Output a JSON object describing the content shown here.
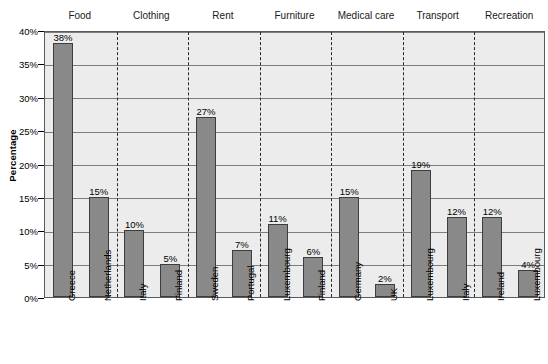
{
  "chart_data": {
    "type": "bar",
    "title": "",
    "xlabel": "",
    "ylabel": "Percentage",
    "ylim": [
      0,
      40
    ],
    "ytick_labels": [
      "0%",
      "5%",
      "10%",
      "15%",
      "20%",
      "25%",
      "30%",
      "35%",
      "40%"
    ],
    "ytick_values": [
      0,
      5,
      10,
      15,
      20,
      25,
      30,
      35,
      40
    ],
    "grid": "horizontal",
    "legend": "none",
    "group_separators": "dashed vertical lines",
    "categories": [
      "Greece",
      "Netherlands",
      "Italy",
      "Finland",
      "Sweden",
      "Portugal",
      "Luxembourg",
      "Finland",
      "Germany",
      "UK",
      "Luxembourg",
      "Italy",
      "Ireland",
      "Luxembourg"
    ],
    "values": [
      38,
      15,
      10,
      5,
      27,
      7,
      11,
      6,
      15,
      2,
      19,
      12,
      12,
      4
    ],
    "data_labels": [
      "38%",
      "15%",
      "10%",
      "5%",
      "27%",
      "7%",
      "11%",
      "6%",
      "15%",
      "2%",
      "19%",
      "12%",
      "12%",
      "4%"
    ],
    "groups": [
      {
        "label": "Food",
        "members": [
          "Greece",
          "Netherlands"
        ]
      },
      {
        "label": "Clothing",
        "members": [
          "Italy",
          "Finland"
        ]
      },
      {
        "label": "Rent",
        "members": [
          "Sweden",
          "Portugal"
        ]
      },
      {
        "label": "Furniture",
        "members": [
          "Luxembourg",
          "Finland"
        ]
      },
      {
        "label": "Medical care",
        "members": [
          "Germany",
          "UK"
        ]
      },
      {
        "label": "Transport",
        "members": [
          "Luxembourg",
          "Italy"
        ]
      },
      {
        "label": "Recreation",
        "members": [
          "Ireland",
          "Luxembourg"
        ]
      }
    ],
    "colors": {
      "bar_fill": "#898989",
      "bar_border": "#3d3d3d",
      "plot_background": "#ececec",
      "gridline": "#7d7d7d",
      "axis": "#5a5a5a",
      "divider": "#2b2b2b",
      "text": "#000000"
    }
  }
}
